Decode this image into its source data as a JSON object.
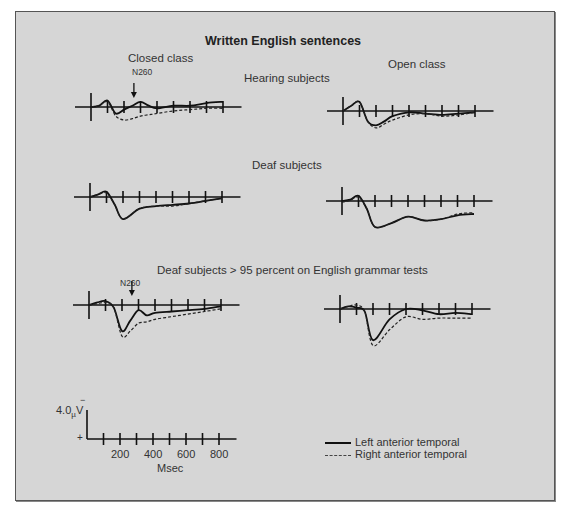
{
  "figure": {
    "title": "Written English sentences",
    "column_labels": {
      "left": "Closed class",
      "right": "Open class"
    },
    "row_labels": [
      "Hearing subjects",
      "Deaf subjects",
      "Deaf subjects > 95 percent on English grammar tests"
    ],
    "annotations": {
      "n260_row1": "N260",
      "n260_row3": "N260"
    },
    "scale": {
      "amplitude_label": "4.0",
      "unit_mu": "µ",
      "unit_v": "V",
      "minus_sign": "−",
      "plus_sign": "+",
      "x_tick_labels": [
        "200",
        "400",
        "600",
        "800"
      ],
      "x_label": "Msec"
    },
    "legend": [
      {
        "label": "Left anterior temporal",
        "style": "solid"
      },
      {
        "label": "Right anterior temporal",
        "style": "dashed"
      }
    ]
  },
  "chart_data": [
    {
      "type": "line",
      "title": "Hearing subjects — Closed class",
      "xlabel": "Msec",
      "ylabel": "µV (negative up)",
      "x": [
        0,
        50,
        100,
        150,
        200,
        250,
        300,
        350,
        400,
        500,
        600,
        700,
        800
      ],
      "series": [
        {
          "name": "Left anterior temporal",
          "values": [
            0,
            0.5,
            2.5,
            -2.5,
            -1.0,
            0.5,
            2.0,
            0.5,
            -0.5,
            0.5,
            0.5,
            1.5,
            2.0
          ]
        },
        {
          "name": "Right anterior temporal",
          "values": [
            0,
            0.5,
            2.0,
            -3.5,
            -5.0,
            -4.5,
            -3.5,
            -3.0,
            -2.5,
            -1.5,
            -1.0,
            -0.5,
            -0.5
          ]
        }
      ],
      "annotation": "N260"
    },
    {
      "type": "line",
      "title": "Hearing subjects — Open class",
      "xlabel": "Msec",
      "ylabel": "µV (negative up)",
      "x": [
        0,
        50,
        100,
        150,
        200,
        250,
        300,
        400,
        500,
        600,
        700,
        800
      ],
      "series": [
        {
          "name": "Left anterior temporal",
          "values": [
            0,
            2.0,
            3.5,
            -4.0,
            -5.5,
            -4.0,
            -2.0,
            -0.5,
            -1.0,
            -1.5,
            -1.0,
            -0.5
          ]
        },
        {
          "name": "Right anterior temporal",
          "values": [
            0,
            2.0,
            3.5,
            -4.0,
            -6.5,
            -5.0,
            -3.5,
            -1.5,
            -1.0,
            -2.0,
            -1.5,
            -0.5
          ]
        }
      ]
    },
    {
      "type": "line",
      "title": "Deaf subjects — Closed class",
      "xlabel": "Msec",
      "ylabel": "µV (negative up)",
      "x": [
        0,
        50,
        100,
        150,
        200,
        300,
        400,
        500,
        600,
        700,
        800
      ],
      "series": [
        {
          "name": "Left anterior temporal",
          "values": [
            0,
            1.0,
            2.0,
            -3.0,
            -8.5,
            -4.5,
            -3.5,
            -3.0,
            -2.5,
            -1.5,
            -0.5
          ]
        },
        {
          "name": "Right anterior temporal",
          "values": [
            0,
            1.0,
            1.5,
            -3.0,
            -8.5,
            -4.5,
            -3.5,
            -3.5,
            -2.5,
            -1.5,
            -0.5
          ]
        }
      ]
    },
    {
      "type": "line",
      "title": "Deaf subjects — Open class",
      "xlabel": "Msec",
      "ylabel": "µV (negative up)",
      "x": [
        0,
        50,
        100,
        150,
        200,
        300,
        400,
        500,
        600,
        700,
        800
      ],
      "series": [
        {
          "name": "Left anterior temporal",
          "values": [
            0,
            0.5,
            2.0,
            -3.0,
            -10.0,
            -8.5,
            -6.0,
            -7.5,
            -7.0,
            -5.5,
            -5.0
          ]
        },
        {
          "name": "Right anterior temporal",
          "values": [
            -0.5,
            0.3,
            1.5,
            -3.0,
            -10.0,
            -8.5,
            -6.0,
            -7.5,
            -7.0,
            -5.0,
            -4.5
          ]
        }
      ]
    },
    {
      "type": "line",
      "title": "Deaf subjects > 95% — Closed class",
      "xlabel": "Msec",
      "ylabel": "µV (negative up)",
      "x": [
        0,
        50,
        100,
        150,
        200,
        250,
        300,
        350,
        400,
        500,
        600,
        700,
        800
      ],
      "series": [
        {
          "name": "Left anterior temporal",
          "values": [
            0,
            1.0,
            1.5,
            -1.0,
            -10.0,
            -6.0,
            -2.0,
            -4.0,
            -3.0,
            -2.5,
            -2.0,
            -1.5,
            -0.5
          ]
        },
        {
          "name": "Right anterior temporal",
          "values": [
            0,
            0.5,
            1.0,
            -1.0,
            -12.0,
            -10.0,
            -7.0,
            -6.5,
            -5.5,
            -4.5,
            -3.5,
            -2.5,
            -1.5
          ]
        }
      ],
      "annotation": "N260"
    },
    {
      "type": "line",
      "title": "Deaf subjects > 95% — Open class",
      "xlabel": "Msec",
      "ylabel": "µV (negative up)",
      "x": [
        0,
        50,
        100,
        150,
        200,
        300,
        400,
        500,
        600,
        700,
        800
      ],
      "series": [
        {
          "name": "Left anterior temporal",
          "values": [
            0,
            1.0,
            0.5,
            -1.0,
            -12.0,
            -4.0,
            0.0,
            -0.5,
            -2.0,
            -1.5,
            -2.0
          ]
        },
        {
          "name": "Right anterior temporal",
          "values": [
            0,
            1.0,
            1.5,
            -1.0,
            -14.0,
            -8.0,
            -3.0,
            -4.0,
            -3.5,
            -3.5,
            -3.5
          ]
        }
      ]
    }
  ]
}
